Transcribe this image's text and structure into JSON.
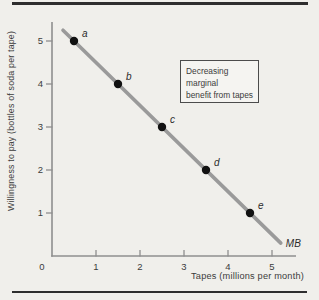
{
  "figure": {
    "background": "#f0efeb",
    "rule_color": "#2e2e2e"
  },
  "chart_data": {
    "type": "line",
    "title": "",
    "xlabel": "Tapes (millions per month)",
    "ylabel": "Willingness to pay (bottles of soda per tape)",
    "xlim": [
      0,
      5.5
    ],
    "ylim": [
      0,
      5.5
    ],
    "grid": false,
    "axis_color": "#8f8f8f",
    "x_ticks": [
      0,
      1,
      2,
      3,
      4,
      5
    ],
    "y_ticks": [
      1,
      2,
      3,
      4,
      5
    ],
    "curve": {
      "name": "MB",
      "color": "#9a9a9a",
      "start": {
        "x": 0.25,
        "y": 5.25
      },
      "end": {
        "x": 5.2,
        "y": 0.3
      }
    },
    "points": [
      {
        "label": "a",
        "x": 0.5,
        "y": 5
      },
      {
        "label": "b",
        "x": 1.5,
        "y": 4
      },
      {
        "label": "c",
        "x": 2.5,
        "y": 3
      },
      {
        "label": "d",
        "x": 3.5,
        "y": 2
      },
      {
        "label": "e",
        "x": 4.5,
        "y": 1
      }
    ],
    "point_color": "#111111",
    "annotation": {
      "lines": [
        "Decreasing",
        "marginal",
        "benefit from tapes"
      ]
    }
  }
}
